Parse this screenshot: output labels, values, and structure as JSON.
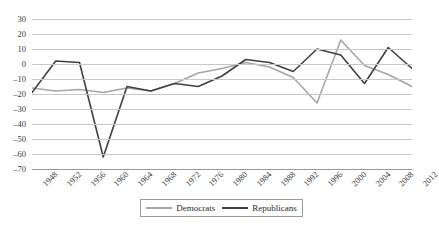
{
  "chart_data": {
    "type": "line",
    "title": "",
    "subtitle": "",
    "xlabel": "",
    "ylabel": "",
    "grid": true,
    "legend_position": "bottom",
    "ylim": [
      -70,
      30
    ],
    "yticks": [
      30,
      20,
      10,
      0,
      -10,
      -20,
      -30,
      -40,
      -50,
      -60,
      -70
    ],
    "ytick_labels": [
      "30",
      "20",
      "10",
      "0",
      "–10",
      "–20",
      "–30",
      "–40",
      "–50",
      "–60",
      "–70"
    ],
    "categories": [
      "1948",
      "1952",
      "1956",
      "1960",
      "1964",
      "1968",
      "1972",
      "1976",
      "1980",
      "1984",
      "1988",
      "1992",
      "1996",
      "2000",
      "2004",
      "2008",
      "2012"
    ],
    "series": [
      {
        "name": "Democrats",
        "color": "#a6a6a6",
        "values": [
          -16,
          -18,
          -17,
          -19,
          -16,
          -18,
          -13,
          -6,
          -3,
          1,
          -2,
          -9,
          -26,
          16,
          -1,
          -7,
          -15
        ]
      },
      {
        "name": "Republicans",
        "color": "#404040",
        "values": [
          -19,
          2,
          1,
          -62,
          -15,
          -18,
          -13,
          -15,
          -8,
          3,
          1,
          -5,
          10,
          6,
          -13,
          11,
          -3
        ]
      }
    ]
  },
  "legend": {
    "entries": [
      {
        "label": "Democrats",
        "color": "#a6a6a6"
      },
      {
        "label": "Republicans",
        "color": "#404040"
      }
    ]
  },
  "axis": {
    "y_tick_labels": [
      "30",
      "20",
      "10",
      "0",
      "–10",
      "–20",
      "–30",
      "–40",
      "–50",
      "–60",
      "–70"
    ],
    "x_tick_labels": [
      "1948",
      "1952",
      "1956",
      "1960",
      "1964",
      "1968",
      "1972",
      "1976",
      "1980",
      "1984",
      "1988",
      "1992",
      "1996",
      "2000",
      "2004",
      "2008",
      "2012"
    ]
  }
}
